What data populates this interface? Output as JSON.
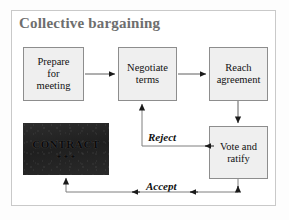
{
  "figure": {
    "title": "Collective bargaining",
    "frame_border_color": "#c9c9c9",
    "background_color": "#ffffff"
  },
  "style": {
    "box_fill": "#efefef",
    "box_border": "#8d8d8d",
    "contract_fill": "#242424",
    "title_color": "#6e6e6e",
    "arrow_color": "#1a1a1a",
    "line_color": "#7f7f7f"
  },
  "nodes": [
    {
      "id": "prepare",
      "type": "process",
      "label_lines": [
        "Prepare",
        "for",
        "meeting"
      ],
      "line1": "Prepare",
      "line2": "for",
      "line3": "meeting"
    },
    {
      "id": "negotiate",
      "type": "process",
      "label_lines": [
        "Negotiate",
        "terms"
      ],
      "line1": "Negotiate",
      "line2": "terms"
    },
    {
      "id": "reach",
      "type": "process",
      "label_lines": [
        "Reach",
        "agreement"
      ],
      "line1": "Reach",
      "line2": "agreement"
    },
    {
      "id": "vote",
      "type": "process",
      "label_lines": [
        "Vote and",
        "ratify"
      ],
      "line1": "Vote and",
      "line2": "ratify"
    },
    {
      "id": "contract",
      "type": "artifact",
      "label": "CONTRACT",
      "marks": "✦✦✦"
    }
  ],
  "edges": [
    {
      "id": "prepare-to-negotiate",
      "from": "prepare",
      "to": "negotiate",
      "label": ""
    },
    {
      "id": "negotiate-to-reach",
      "from": "negotiate",
      "to": "reach",
      "label": ""
    },
    {
      "id": "reach-to-vote",
      "from": "reach",
      "to": "vote",
      "label": ""
    },
    {
      "id": "vote-to-negotiate",
      "from": "vote",
      "to": "negotiate",
      "label": "Reject"
    },
    {
      "id": "vote-to-contract",
      "from": "vote",
      "to": "contract",
      "label": "Accept"
    }
  ],
  "labels": {
    "reject": "Reject",
    "accept": "Accept"
  }
}
